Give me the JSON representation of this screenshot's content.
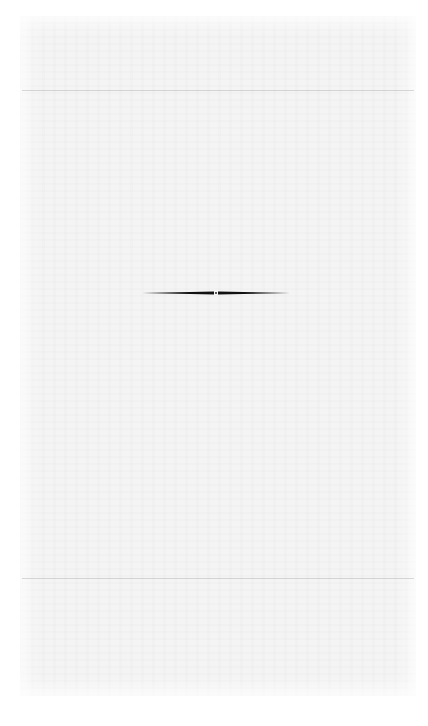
{
  "page": {
    "type": "blank-scanned-page",
    "background_color": "#f4f4f4",
    "ornament": {
      "name": "section-divider",
      "color": "#111111"
    }
  }
}
